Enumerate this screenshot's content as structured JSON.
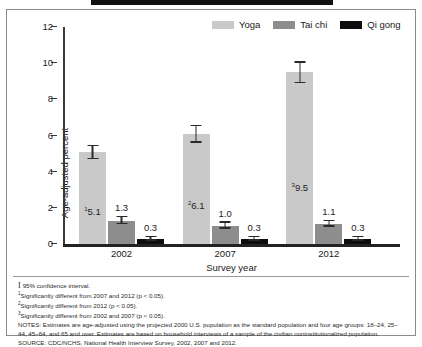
{
  "figure": {
    "y_axis_title": "Age-adjusted percent",
    "x_axis_title": "Survey year"
  },
  "legend": {
    "items": [
      {
        "label": "Yoga",
        "color": "#c9c9c9"
      },
      {
        "label": "Tai chi",
        "color": "#8d8d8d"
      },
      {
        "label": "Qi gong",
        "color": "#0d0d0d"
      }
    ]
  },
  "notes": {
    "ci_symbol": "I",
    "ci_text": "95% confidence interval.",
    "footnote1_marker": "1",
    "footnote1_text": "Significantly different from 2007 and 2012 (p < 0.05).",
    "footnote2_marker": "2",
    "footnote2_text": "Significantly different from 2012 (p < 0.05).",
    "footnote3_marker": "3",
    "footnote3_text": "Significantly different from 2002 and 2007 (p < 0.05).",
    "notes_paragraph": "NOTES: Estimates are age-adjusted using the projected 2000 U.S. population as the standard population and four age groups: 18–24, 25–44, 45–64, and 65 and over. Estimates are based on household interviews of a sample of the civilian noninstitutionalized population.",
    "source": "SOURCE: CDC/NCHS, National Health Interview Survey, 2002, 2007 and 2012."
  },
  "chart_data": {
    "type": "bar",
    "title": "",
    "xlabel": "Survey year",
    "ylabel": "Age-adjusted percent",
    "ylim": [
      0,
      12
    ],
    "yticks": [
      0,
      2,
      4,
      6,
      8,
      10,
      12
    ],
    "grid": false,
    "legend_position": "top-right",
    "categories": [
      "2002",
      "2007",
      "2012"
    ],
    "series": [
      {
        "name": "Yoga",
        "color": "#c9c9c9",
        "values": [
          5.1,
          6.1,
          9.5
        ],
        "labels": [
          "5.1",
          "6.1",
          "9.5"
        ],
        "label_markers": [
          "1",
          "2",
          "3"
        ],
        "ci_low": [
          4.7,
          5.6,
          8.9
        ],
        "ci_high": [
          5.5,
          6.6,
          10.1
        ]
      },
      {
        "name": "Tai chi",
        "color": "#8d8d8d",
        "values": [
          1.3,
          1.0,
          1.1
        ],
        "labels": [
          "1.3",
          "1.0",
          "1.1"
        ],
        "label_markers": [
          "",
          "",
          ""
        ],
        "ci_low": [
          1.1,
          0.85,
          0.95
        ],
        "ci_high": [
          1.55,
          1.25,
          1.35
        ]
      },
      {
        "name": "Qi gong",
        "color": "#0d0d0d",
        "values": [
          0.3,
          0.3,
          0.3
        ],
        "labels": [
          "0.3",
          "0.3",
          "0.3"
        ],
        "label_markers": [
          "",
          "",
          ""
        ],
        "ci_low": [
          0.18,
          0.18,
          0.18
        ],
        "ci_high": [
          0.45,
          0.45,
          0.45
        ]
      }
    ]
  }
}
